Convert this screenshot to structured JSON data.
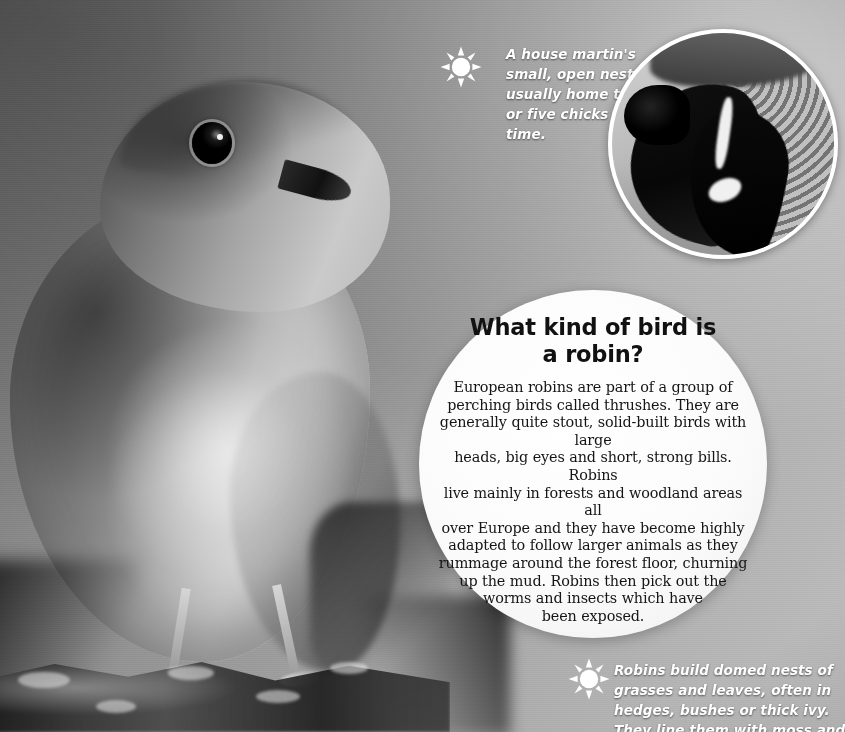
{
  "page": {
    "background_tone": "#9a9a9a"
  },
  "caption_top": {
    "icon": "sun-icon",
    "text": "A house martin's small, open nest is usually home to four or five chicks at a time."
  },
  "caption_bottom": {
    "icon": "sun-icon",
    "text": "Robins build domed nests of grasses and leaves, often in hedges, bushes or thick ivy. They line them with moss and animal hair."
  },
  "inset_photo": {
    "subject": "house martin at mud nest",
    "shape": "circle",
    "border_color": "#ffffff"
  },
  "main_photo": {
    "subject": "european robin perched on a branch",
    "treatment": "greyscale"
  },
  "info_circle": {
    "title_line1": "What kind of",
    "title_line2": "bird is a robin?",
    "body_lines": [
      "European robins are part of a group of",
      "perching birds called thrushes. They are",
      "generally quite stout, solid-built birds with large",
      "heads, big eyes and short, strong bills. Robins",
      "live mainly in forests and woodland areas all",
      "over Europe and they have become highly",
      "adapted to follow larger animals as they",
      "rummage around the forest floor, churning",
      "up the mud. Robins then pick out the",
      "worms and insects which have",
      "been exposed."
    ]
  }
}
